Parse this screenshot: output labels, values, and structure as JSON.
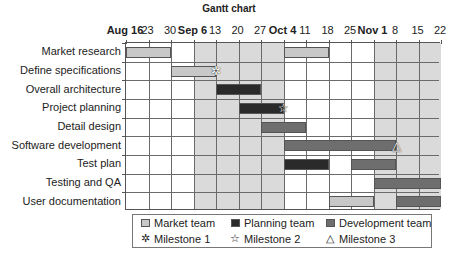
{
  "chart_data": {
    "type": "gantt",
    "title": "Gantt chart",
    "xlabel": "",
    "ylabel": "",
    "x_ticks": [
      "Aug 16",
      "23",
      "30",
      "Sep 6",
      "13",
      "20",
      "27",
      "Oct 4",
      "11",
      "18",
      "25",
      "Nov 1",
      "8",
      "15",
      "22"
    ],
    "x_ticks_bold": [
      "Aug 16",
      "Sep 6",
      "Oct 4",
      "Nov 1"
    ],
    "shaded_ranges": [
      {
        "start": "Sep 6",
        "end": "Oct 4"
      },
      {
        "start": "Nov 1",
        "end": "Nov 22"
      }
    ],
    "grid": true,
    "legend_position": "bottom",
    "categories": [
      "Market research",
      "Define specifications",
      "Overall architecture",
      "Project planning",
      "Detail design",
      "Software development",
      "Test plan",
      "Testing and QA",
      "User documentation"
    ],
    "teams": {
      "market": {
        "name": "Market team",
        "color": "#c8c8c8"
      },
      "planning": {
        "name": "Planning team",
        "color": "#2a2a2a"
      },
      "development": {
        "name": "Development team",
        "color": "#6e6e6e"
      }
    },
    "tasks": [
      {
        "task": "Market research",
        "team": "market",
        "start": "Aug 16",
        "end": "Aug 30"
      },
      {
        "task": "Market research",
        "team": "market",
        "start": "Oct 4",
        "end": "Oct 18"
      },
      {
        "task": "Define specifications",
        "team": "market",
        "start": "Aug 30",
        "end": "Sep 13"
      },
      {
        "task": "Overall architecture",
        "team": "planning",
        "start": "Sep 13",
        "end": "Sep 27"
      },
      {
        "task": "Project planning",
        "team": "planning",
        "start": "Sep 20",
        "end": "Oct 4"
      },
      {
        "task": "Detail design",
        "team": "development",
        "start": "Sep 27",
        "end": "Oct 11"
      },
      {
        "task": "Software development",
        "team": "development",
        "start": "Oct 4",
        "end": "Nov 8"
      },
      {
        "task": "Test plan",
        "team": "planning",
        "start": "Oct 4",
        "end": "Oct 18"
      },
      {
        "task": "Test plan",
        "team": "development",
        "start": "Oct 25",
        "end": "Nov 8"
      },
      {
        "task": "Testing and QA",
        "team": "development",
        "start": "Nov 1",
        "end": "Nov 22"
      },
      {
        "task": "User documentation",
        "team": "market",
        "start": "Oct 18",
        "end": "Nov 1"
      },
      {
        "task": "User documentation",
        "team": "development",
        "start": "Nov 8",
        "end": "Nov 22"
      }
    ],
    "milestones": [
      {
        "name": "Milestone 1",
        "task": "Define specifications",
        "date": "Sep 13",
        "symbol": "✲"
      },
      {
        "name": "Milestone 2",
        "task": "Project planning",
        "date": "Oct 4",
        "symbol": "☆"
      },
      {
        "name": "Milestone 3",
        "task": "Software development",
        "date": "Nov 8",
        "symbol": "△"
      }
    ]
  },
  "legend": {
    "items": [
      {
        "label": "Market team",
        "kind": "swatch",
        "color": "#c8c8c8"
      },
      {
        "label": "Planning team",
        "kind": "swatch",
        "color": "#2a2a2a"
      },
      {
        "label": "Development team",
        "kind": "swatch",
        "color": "#6e6e6e"
      },
      {
        "label": "Milestone 1",
        "kind": "symbol",
        "symbol": "✲"
      },
      {
        "label": "Milestone 2",
        "kind": "symbol",
        "symbol": "☆"
      },
      {
        "label": "Milestone 3",
        "kind": "symbol",
        "symbol": "△"
      }
    ]
  }
}
